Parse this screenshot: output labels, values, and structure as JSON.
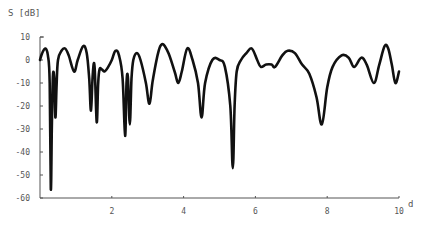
{
  "chart_data": {
    "type": "line",
    "title": "",
    "xlabel": "d",
    "ylabel": "S [dB]",
    "xlim": [
      0,
      10
    ],
    "ylim": [
      -60,
      10
    ],
    "xticks": [
      2,
      4,
      6,
      8,
      10
    ],
    "yticks": [
      10,
      0,
      -10,
      -20,
      -30,
      -40,
      -50,
      -60
    ],
    "grid": false,
    "legend": null,
    "series": [
      {
        "name": "S",
        "color": "#111111",
        "x": [
          0.0,
          0.06,
          0.15,
          0.22,
          0.27,
          0.3,
          0.33,
          0.36,
          0.4,
          0.43,
          0.46,
          0.5,
          0.6,
          0.7,
          0.8,
          0.95,
          1.05,
          1.2,
          1.3,
          1.37,
          1.42,
          1.47,
          1.52,
          1.58,
          1.62,
          1.66,
          1.72,
          1.8,
          1.9,
          2.0,
          2.1,
          2.2,
          2.3,
          2.37,
          2.41,
          2.45,
          2.5,
          2.55,
          2.6,
          2.7,
          2.8,
          2.95,
          3.05,
          3.15,
          3.35,
          3.55,
          3.75,
          3.85,
          3.95,
          4.1,
          4.25,
          4.4,
          4.5,
          4.6,
          4.8,
          5.0,
          5.15,
          5.3,
          5.37,
          5.42,
          5.48,
          5.6,
          5.75,
          5.9,
          6.05,
          6.15,
          6.3,
          6.45,
          6.55,
          6.75,
          6.9,
          7.1,
          7.3,
          7.5,
          7.7,
          7.85,
          8.0,
          8.15,
          8.4,
          8.6,
          8.75,
          8.95,
          9.1,
          9.3,
          9.45,
          9.6,
          9.7,
          9.8,
          9.9,
          10.0
        ],
        "y": [
          0,
          3,
          5,
          2,
          -10,
          -56,
          -30,
          -7,
          -9,
          -25,
          -12,
          0,
          4,
          5,
          2,
          -5,
          0,
          6,
          3,
          -8,
          -22,
          -6,
          -3,
          -27,
          -10,
          -4,
          -4,
          -5,
          -3,
          0,
          4,
          2,
          -8,
          -33,
          -10,
          -8,
          -28,
          -8,
          0,
          3,
          0,
          -10,
          -19,
          -8,
          6,
          4,
          -5,
          -10,
          -5,
          5,
          0,
          -10,
          -25,
          -10,
          0,
          0,
          -3,
          -20,
          -47,
          -20,
          -5,
          0,
          3,
          5,
          0,
          -3,
          -2,
          -2,
          -3,
          2,
          4,
          3,
          -2,
          -6,
          -16,
          -28,
          -12,
          -3,
          2,
          1,
          -3,
          1,
          -2,
          -10,
          -2,
          6,
          5,
          -2,
          -10,
          -5
        ]
      }
    ]
  }
}
